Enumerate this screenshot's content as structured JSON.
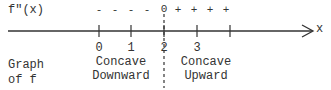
{
  "function_label": "f\"(x)",
  "axis_label": "x",
  "signs": {
    "negative": [
      "-",
      "-",
      "-",
      "-"
    ],
    "zero": "0",
    "positive": [
      "+",
      "+",
      "+",
      "+"
    ]
  },
  "ticks": [
    "0",
    "1",
    "2",
    "3"
  ],
  "graph_label_line1": "Graph",
  "graph_label_line2": "of f",
  "left_region": {
    "line1": "Concave",
    "line2": "Downward"
  },
  "right_region": {
    "line1": "Concave",
    "line2": "Upward"
  },
  "colors": {
    "ink": "#333333",
    "background": "#ffffff"
  }
}
